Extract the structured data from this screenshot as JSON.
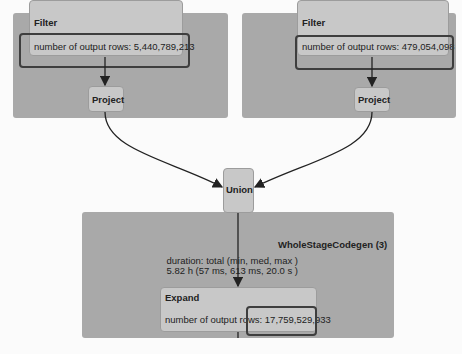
{
  "left_branch": {
    "filter": {
      "title": "Filter",
      "metric": "number of output rows: 5,440,789,213"
    },
    "project": {
      "title": "Project"
    }
  },
  "right_branch": {
    "filter": {
      "title": "Filter",
      "metric": "number of output rows: 479,054,098"
    },
    "project": {
      "title": "Project"
    }
  },
  "union": {
    "title": "Union"
  },
  "codegen": {
    "title": "WholeStageCodegen (3)",
    "duration_label": "duration: total (min, med, max )",
    "duration_value": "5.82 h (57 ms, 613 ms, 20.0 s )",
    "expand": {
      "title": "Expand",
      "metric_prefix": "number of output rows: ",
      "metric_value": "17,759,529,933"
    }
  },
  "colors": {
    "cluster": "#a9a9a9",
    "node": "#c8c8c8",
    "highlight": "#3e3e3e",
    "edge": "#222222"
  }
}
